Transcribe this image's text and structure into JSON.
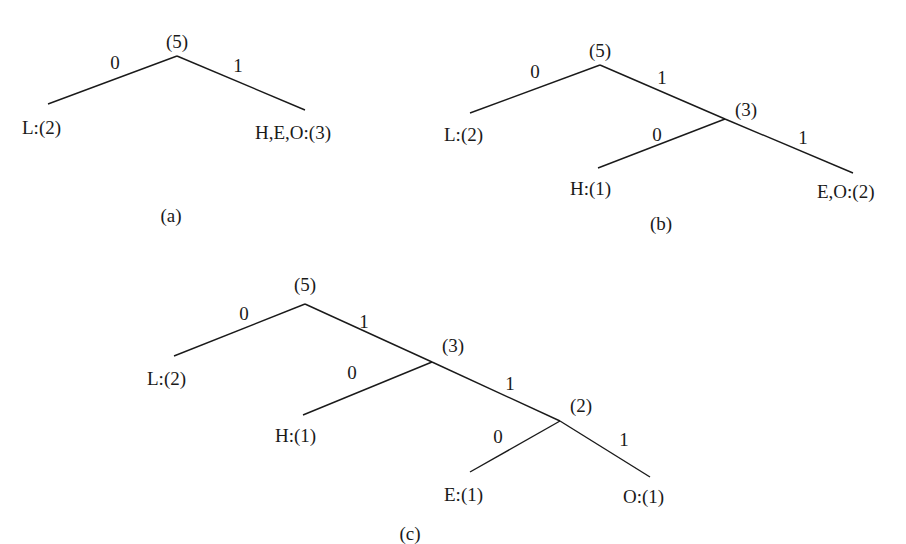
{
  "diagrams": [
    {
      "caption": "(a)",
      "nodes": [
        {
          "id": "root",
          "label": "(5)"
        },
        {
          "id": "L",
          "label": "L:(2)"
        },
        {
          "id": "HEO",
          "label": "H,E,O:(3)"
        }
      ],
      "edges": [
        {
          "from": "root",
          "to": "L",
          "bit": "0"
        },
        {
          "from": "root",
          "to": "HEO",
          "bit": "1"
        }
      ]
    },
    {
      "caption": "(b)",
      "nodes": [
        {
          "id": "root",
          "label": "(5)"
        },
        {
          "id": "L",
          "label": "L:(2)"
        },
        {
          "id": "n3",
          "label": "(3)"
        },
        {
          "id": "H",
          "label": "H:(1)"
        },
        {
          "id": "EO",
          "label": "E,O:(2)"
        }
      ],
      "edges": [
        {
          "from": "root",
          "to": "L",
          "bit": "0"
        },
        {
          "from": "root",
          "to": "n3",
          "bit": "1"
        },
        {
          "from": "n3",
          "to": "H",
          "bit": "0"
        },
        {
          "from": "n3",
          "to": "EO",
          "bit": "1"
        }
      ]
    },
    {
      "caption": "(c)",
      "nodes": [
        {
          "id": "root",
          "label": "(5)"
        },
        {
          "id": "L",
          "label": "L:(2)"
        },
        {
          "id": "n3",
          "label": "(3)"
        },
        {
          "id": "H",
          "label": "H:(1)"
        },
        {
          "id": "n2",
          "label": "(2)"
        },
        {
          "id": "E",
          "label": "E:(1)"
        },
        {
          "id": "O",
          "label": "O:(1)"
        }
      ],
      "edges": [
        {
          "from": "root",
          "to": "L",
          "bit": "0"
        },
        {
          "from": "root",
          "to": "n3",
          "bit": "1"
        },
        {
          "from": "n3",
          "to": "H",
          "bit": "0"
        },
        {
          "from": "n3",
          "to": "n2",
          "bit": "1"
        },
        {
          "from": "n2",
          "to": "E",
          "bit": "0"
        },
        {
          "from": "n2",
          "to": "O",
          "bit": "1"
        }
      ]
    }
  ]
}
